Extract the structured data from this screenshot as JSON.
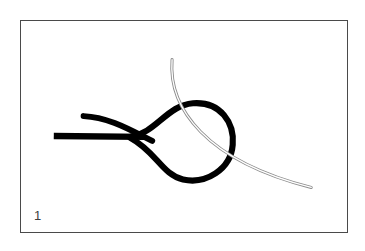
{
  "figure": {
    "number_label": "1",
    "caption": "",
    "frame": {
      "border_color": "#4a4a4a",
      "background_color": "#ffffff",
      "x": 20,
      "y": 20,
      "width": 328,
      "height": 213
    },
    "elements": [
      {
        "name": "suture-strand-straight",
        "kind": "thick-stroke",
        "color": "#000000",
        "stroke_width": 6,
        "description": "horizontal thick black suture tail entering from the left",
        "path": "M 33 116 L 120 116"
      },
      {
        "name": "suture-strand-upper-limb",
        "kind": "thick-stroke",
        "color": "#000000",
        "stroke_width": 6,
        "description": "thick black strand curving down from upper left, crossing the straight tail",
        "path": "M 64 96 C 90 97 112 112 130 120"
      },
      {
        "name": "suture-loop",
        "kind": "thick-stroke",
        "color": "#000000",
        "stroke_width": 6,
        "description": "thick black suture forming a closed teardrop loop to the right",
        "path": "M 108 116 C 135 112 148 86 172 84 C 200 82 214 104 212 124 C 210 148 186 163 164 159 C 143 155 137 133 108 118 Z"
      },
      {
        "name": "needle-curve",
        "kind": "thin-double-stroke",
        "color": "#8a8a8a",
        "stroke_width": 1,
        "description": "thin hollow needle/wire arc passing through the loop from upper area to lower right",
        "path": "M 150 40 C 150 90 185 140 292 168"
      }
    ],
    "colors": {
      "suture": "#000000",
      "needle_outline": "#8d8d8d",
      "needle_core": "#ffffff",
      "frame_border": "#4a4a4a",
      "page_background": "#ffffff",
      "label_text": "#3d3d3d"
    }
  }
}
